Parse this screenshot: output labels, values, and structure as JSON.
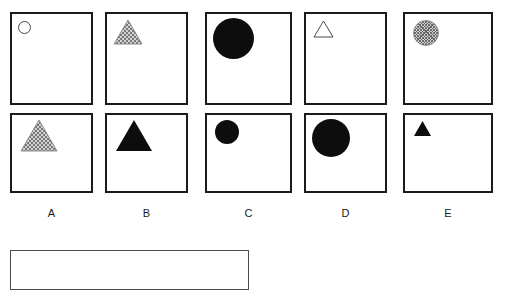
{
  "page": {
    "kind": "visual-analogy-matrix",
    "background_color": "#ffffff",
    "width": 505,
    "height": 287
  },
  "matrix": {
    "rows": 2,
    "columns": 5,
    "border_color": "#1b1b1b",
    "cells": [
      {
        "id": "cell-row1-col1",
        "row": 1,
        "column": 1,
        "x": 10,
        "y": 12,
        "w": 83,
        "h": 93,
        "shape": {
          "type": "circle",
          "fill": "outline",
          "size": 13,
          "offset_x": 6,
          "offset_y": 7,
          "color": "#4a4a4a"
        }
      },
      {
        "id": "cell-row1-col2",
        "row": 1,
        "column": 2,
        "x": 105,
        "y": 12,
        "w": 83,
        "h": 93,
        "shape": {
          "type": "triangle",
          "fill": "hatched",
          "size": 30,
          "offset_x": 6,
          "offset_y": 5,
          "color": "#9a9a9a"
        }
      },
      {
        "id": "cell-row1-col3",
        "row": 1,
        "column": 3,
        "x": 205,
        "y": 12,
        "w": 87,
        "h": 93,
        "shape": {
          "type": "circle",
          "fill": "solid",
          "size": 41,
          "offset_x": 6,
          "offset_y": 4,
          "color": "#0d0d0d"
        }
      },
      {
        "id": "cell-row1-col4",
        "row": 1,
        "column": 4,
        "x": 304,
        "y": 12,
        "w": 83,
        "h": 93,
        "shape": {
          "type": "triangle",
          "fill": "outline",
          "size": 21,
          "offset_x": 7,
          "offset_y": 6,
          "color": "#4a4a4a"
        }
      },
      {
        "id": "cell-row1-col5",
        "row": 1,
        "column": 5,
        "x": 403,
        "y": 12,
        "w": 90,
        "h": 93,
        "shape": {
          "type": "circle",
          "fill": "hatched",
          "size": 26,
          "offset_x": 8,
          "offset_y": 6,
          "color": "#9a9a9a"
        }
      },
      {
        "id": "cell-row2-col1",
        "row": 2,
        "column": 1,
        "x": 10,
        "y": 113,
        "w": 83,
        "h": 80,
        "shape": {
          "type": "triangle",
          "fill": "hatched",
          "size": 38,
          "offset_x": 8,
          "offset_y": 4,
          "color": "#9a9a9a"
        }
      },
      {
        "id": "cell-row2-col2",
        "row": 2,
        "column": 2,
        "x": 105,
        "y": 113,
        "w": 83,
        "h": 80,
        "shape": {
          "type": "triangle",
          "fill": "solid",
          "size": 38,
          "offset_x": 8,
          "offset_y": 4,
          "color": "#0d0d0d"
        }
      },
      {
        "id": "cell-row2-col3",
        "row": 2,
        "column": 3,
        "x": 205,
        "y": 113,
        "w": 87,
        "h": 80,
        "shape": {
          "type": "circle",
          "fill": "solid",
          "size": 24,
          "offset_x": 8,
          "offset_y": 5,
          "color": "#0d0d0d"
        }
      },
      {
        "id": "cell-row2-col4",
        "row": 2,
        "column": 4,
        "x": 304,
        "y": 113,
        "w": 83,
        "h": 80,
        "shape": {
          "type": "circle",
          "fill": "solid",
          "size": 38,
          "offset_x": 6,
          "offset_y": 4,
          "color": "#0d0d0d"
        }
      },
      {
        "id": "cell-row2-col5",
        "row": 2,
        "column": 5,
        "x": 403,
        "y": 113,
        "w": 90,
        "h": 80,
        "shape": {
          "type": "triangle",
          "fill": "solid",
          "size": 19,
          "offset_x": 8,
          "offset_y": 5,
          "color": "#0d0d0d"
        }
      }
    ]
  },
  "labels": [
    {
      "id": "label-a",
      "text": "A",
      "x": 10,
      "y": 207,
      "w": 83
    },
    {
      "id": "label-b",
      "text": "B",
      "x": 105,
      "y": 207,
      "w": 83
    },
    {
      "id": "label-c",
      "text": "C",
      "x": 205,
      "y": 207,
      "w": 87
    },
    {
      "id": "label-d",
      "text": "D",
      "x": 304,
      "y": 207,
      "w": 83
    },
    {
      "id": "label-e",
      "text": "E",
      "x": 403,
      "y": 207,
      "w": 90
    }
  ],
  "answer_box": {
    "id": "answer-box",
    "text": "",
    "x": 10,
    "y": 250,
    "w": 239,
    "h": 40,
    "border_color": "#4c4c4c",
    "background_color": "#ffffff"
  }
}
